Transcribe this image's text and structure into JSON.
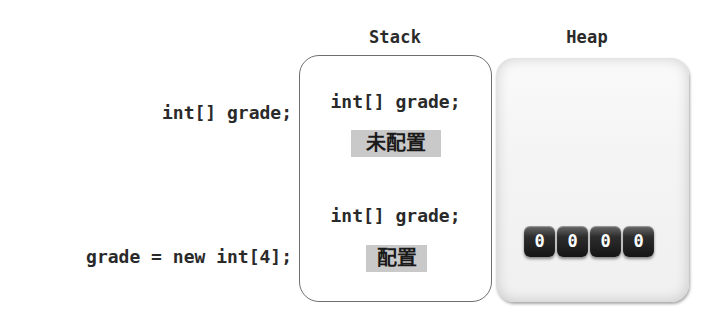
{
  "columns": {
    "stack_title": "Stack",
    "heap_title": "Heap"
  },
  "statements": [
    {
      "code": "int[] grade;"
    },
    {
      "code": "grade = new int[4];"
    }
  ],
  "stack": {
    "entries": [
      {
        "code": "int[] grade;",
        "status": "未配置"
      },
      {
        "code": "int[] grade;",
        "status": "配置"
      }
    ]
  },
  "heap": {
    "array_values": [
      "0",
      "0",
      "0",
      "0"
    ]
  },
  "colors": {
    "badge_bg": "#c9c9c9",
    "cell_bg": "#1f1f1f",
    "box_border": "#6f6f6f"
  }
}
